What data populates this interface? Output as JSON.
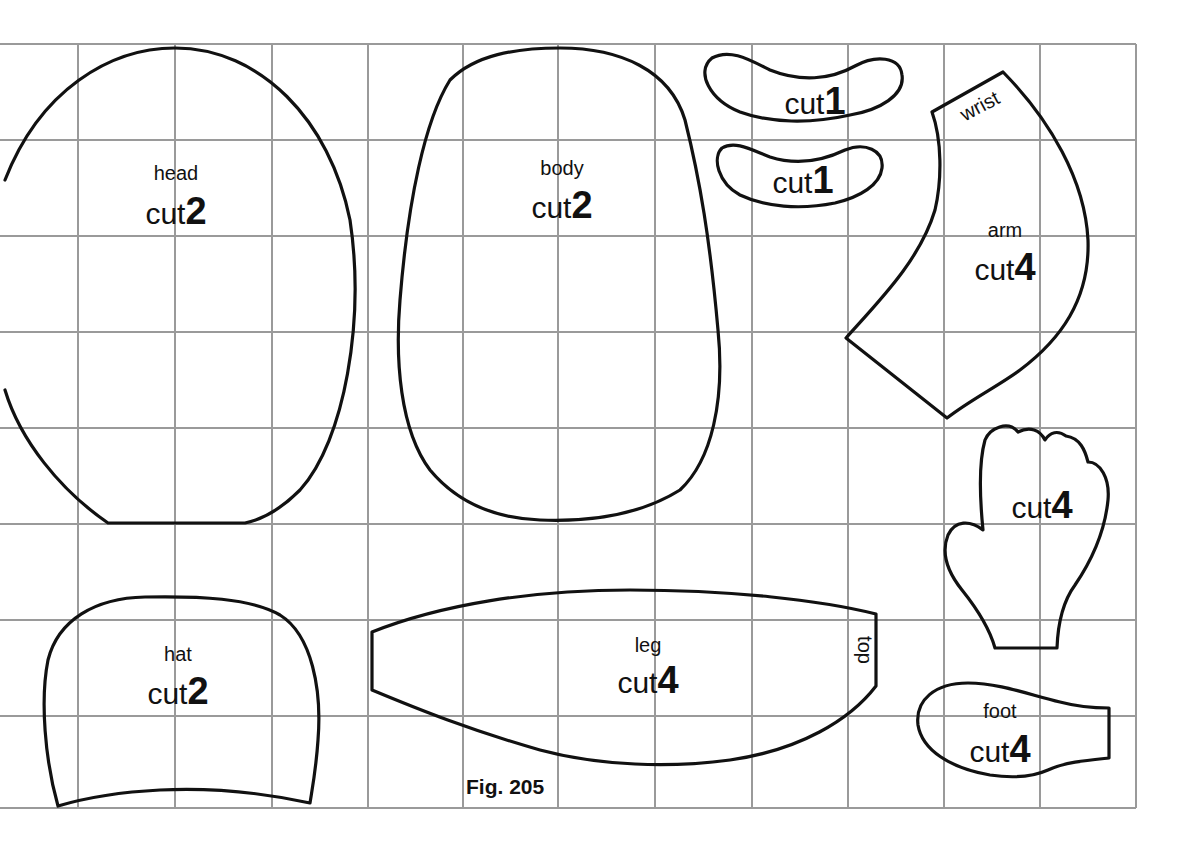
{
  "figure": {
    "caption": "Fig. 205",
    "grid": {
      "spacing_px": 96,
      "color": "#9a9a9a"
    },
    "pieces": {
      "head": {
        "name": "head",
        "cut_word": "cut",
        "cut_count": "2"
      },
      "body": {
        "name": "body",
        "cut_word": "cut",
        "cut_count": "2"
      },
      "ear_top": {
        "cut_word": "cut",
        "cut_count": "1"
      },
      "ear_bottom": {
        "cut_word": "cut",
        "cut_count": "1"
      },
      "arm": {
        "name": "arm",
        "cut_word": "cut",
        "cut_count": "4",
        "edge_label": "wrist"
      },
      "hand": {
        "cut_word": "cut",
        "cut_count": "4"
      },
      "hat": {
        "name": "hat",
        "cut_word": "cut",
        "cut_count": "2"
      },
      "leg": {
        "name": "leg",
        "cut_word": "cut",
        "cut_count": "4",
        "edge_label": "top"
      },
      "foot": {
        "name": "foot",
        "cut_word": "cut",
        "cut_count": "4"
      }
    }
  }
}
